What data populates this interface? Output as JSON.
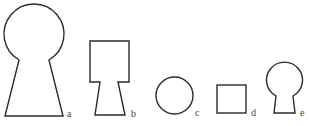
{
  "figure": {
    "stroke_color": "#2a2a2a",
    "label_color": "#444444",
    "shapes": [
      {
        "id": "a",
        "label": "a",
        "kind": "keyhole-large",
        "parts": [
          "circle",
          "trapezoid"
        ]
      },
      {
        "id": "b",
        "label": "b",
        "kind": "square-on-trapezoid",
        "parts": [
          "square",
          "trapezoid"
        ]
      },
      {
        "id": "c",
        "label": "c",
        "kind": "circle",
        "parts": [
          "circle"
        ]
      },
      {
        "id": "d",
        "label": "d",
        "kind": "square",
        "parts": [
          "square"
        ]
      },
      {
        "id": "e",
        "label": "e",
        "kind": "keyhole-small",
        "parts": [
          "circle",
          "trapezoid"
        ]
      }
    ]
  }
}
